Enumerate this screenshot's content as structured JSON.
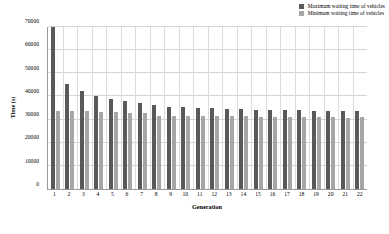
{
  "chart_data": {
    "type": "bar",
    "title": "",
    "xlabel": "Generation",
    "ylabel": "Time (s)",
    "ylim": [
      0,
      70000
    ],
    "ytick_values": [
      0,
      10000,
      20000,
      30000,
      40000,
      50000,
      60000,
      70000
    ],
    "ytick_labels": [
      "0",
      "10000",
      "20000",
      "30000",
      "40000",
      "50000",
      "60000",
      "70000"
    ],
    "grid": true,
    "legend_position": "top-right",
    "categories": [
      "1",
      "2",
      "3",
      "4",
      "5",
      "6",
      "7",
      "8",
      "9",
      "10",
      "11",
      "12",
      "13",
      "14",
      "15",
      "16",
      "17",
      "18",
      "19",
      "20",
      "21",
      "22"
    ],
    "series": [
      {
        "name": "Maximum waiting time of vehicles",
        "color": "#595959",
        "values": [
          70000,
          45400,
          42400,
          40200,
          39100,
          38000,
          37000,
          36100,
          35600,
          35300,
          35100,
          34900,
          34600,
          34400,
          34200,
          34100,
          34000,
          34000,
          33900,
          33800,
          33800,
          33800
        ]
      },
      {
        "name": "Minimum waiting time of vehicles",
        "color": "#a6a6a6",
        "values": [
          33800,
          33800,
          33800,
          33100,
          33100,
          32800,
          32700,
          31500,
          31400,
          31400,
          31400,
          31400,
          31400,
          31400,
          31000,
          31000,
          31000,
          31000,
          31000,
          31000,
          30900,
          31000
        ]
      }
    ]
  },
  "legend": {
    "items": [
      {
        "label": "Maximum waiting time of vehicles",
        "color": "#595959"
      },
      {
        "label": "Minimum waiting time of vehicles",
        "color": "#a6a6a6"
      }
    ]
  },
  "axes": {
    "y_title": "Time (s)",
    "x_title": "Generation"
  }
}
